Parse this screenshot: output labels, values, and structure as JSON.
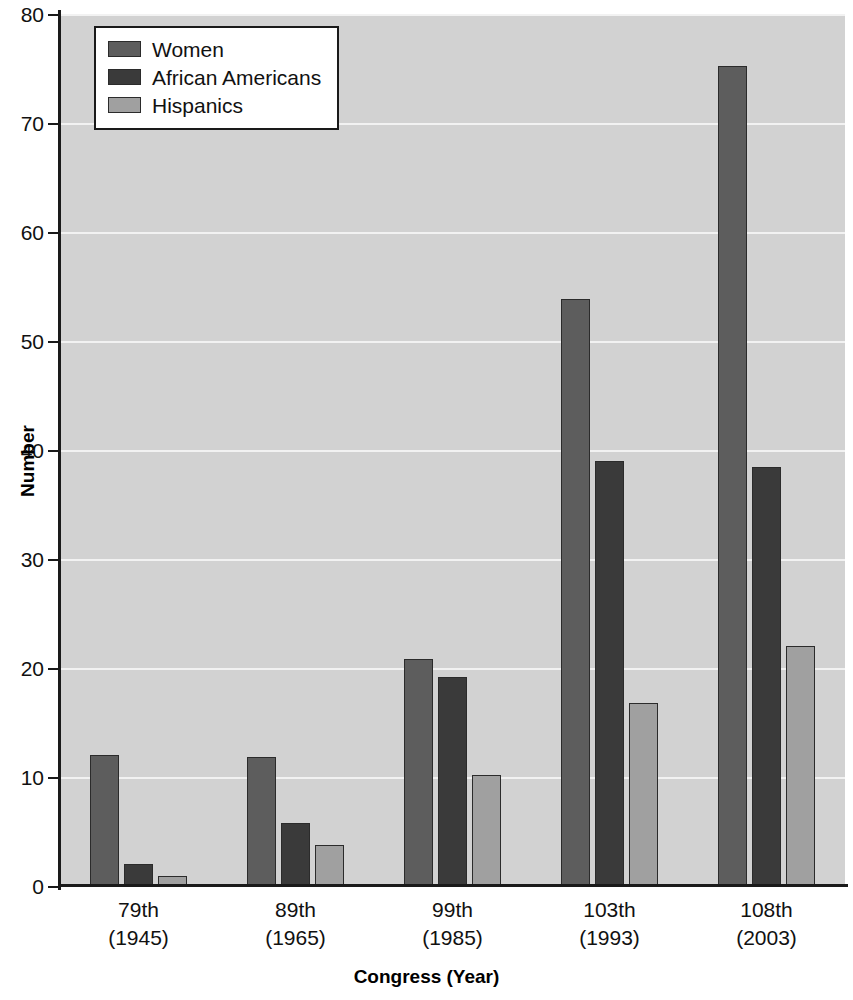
{
  "chart_data": {
    "type": "bar",
    "title": "",
    "xlabel": "Congress (Year)",
    "ylabel": "Number",
    "categories": [
      "79th\n(1945)",
      "89th\n(1965)",
      "99th\n(1985)",
      "103th\n(1993)",
      "108th\n(2003)"
    ],
    "category_lines": [
      {
        "name": "79th",
        "year": "(1945)"
      },
      {
        "name": "89th",
        "year": "(1965)"
      },
      {
        "name": "99th",
        "year": "(1985)"
      },
      {
        "name": "103th",
        "year": "(1993)"
      },
      {
        "name": "108th",
        "year": "(2003)"
      }
    ],
    "series": [
      {
        "name": "Women",
        "color": "#5d5d5d",
        "values": [
          12,
          11.8,
          20.8,
          53.9,
          75.2
        ]
      },
      {
        "name": "African Americans",
        "color": "#3a3a3a",
        "values": [
          2,
          5.8,
          19.2,
          39,
          38.4
        ]
      },
      {
        "name": "Hispanics",
        "color": "#a0a0a0",
        "values": [
          0.9,
          3.8,
          10.2,
          16.8,
          22
        ]
      }
    ],
    "ylim": [
      0,
      80
    ],
    "yticks": [
      0,
      10,
      20,
      30,
      40,
      50,
      60,
      70,
      80
    ],
    "ytick_labels": [
      "0",
      "10",
      "20",
      "30",
      "40",
      "50",
      "60",
      "70",
      "80"
    ],
    "grid": true,
    "grid_color": "#f2f2f2",
    "plot_background": "#d2d2d2",
    "legend_position": "top-left",
    "legend_entries": [
      "Women",
      "African Americans",
      "Hispanics"
    ]
  }
}
